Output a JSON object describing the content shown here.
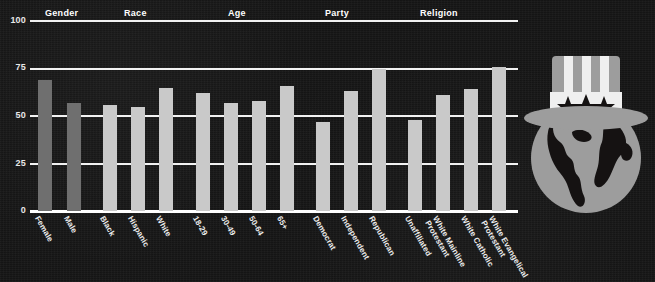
{
  "theme": {
    "background": "#151212",
    "bar_dark": "#6f6f6f",
    "bar_light": "#c9c9c9",
    "axis_color": "#ffffff",
    "text_color": "#ededed"
  },
  "logo": {
    "name": "globe-with-uncle-sam-hat-logo",
    "hat_color": "#9d9d9d",
    "globe_color": "#9d9d9d",
    "land_color": "#151212"
  },
  "chart_data": {
    "type": "bar",
    "title": "",
    "xlabel": "",
    "ylabel": "",
    "ylim": [
      0,
      100
    ],
    "yticks": [
      "0",
      "25",
      "50",
      "75",
      "100"
    ],
    "grid": true,
    "legend": "none",
    "group_headers": [
      "Gender",
      "Race",
      "Age",
      "Party",
      "Religion"
    ],
    "categories": [
      "Female",
      "Male",
      "Black",
      "Hispanic",
      "White",
      "18-29",
      "30-49",
      "50-64",
      "65+",
      "Democrat",
      "Independent",
      "Republican",
      "Unaffiliated",
      "White Mainline\nProtestant",
      "White Catholic",
      "White Evangelical\nProtestant"
    ],
    "values": [
      69,
      57,
      56,
      55,
      65,
      62,
      57,
      58,
      66,
      47,
      63,
      75,
      48,
      61,
      64,
      76
    ],
    "groups": [
      {
        "name": "Gender",
        "categories": [
          "Female",
          "Male"
        ],
        "values": [
          69,
          57
        ],
        "shade": "dark"
      },
      {
        "name": "Race",
        "categories": [
          "Black",
          "Hispanic",
          "White"
        ],
        "values": [
          56,
          55,
          65
        ],
        "shade": "light"
      },
      {
        "name": "Age",
        "categories": [
          "18-29",
          "30-49",
          "50-64",
          "65+"
        ],
        "values": [
          62,
          57,
          58,
          66
        ],
        "shade": "light"
      },
      {
        "name": "Party",
        "categories": [
          "Democrat",
          "Independent",
          "Republican"
        ],
        "values": [
          47,
          63,
          75
        ],
        "shade": "light"
      },
      {
        "name": "Religion",
        "categories": [
          "Unaffiliated",
          "White Mainline Protestant",
          "White Catholic",
          "White Evangelical Protestant"
        ],
        "values": [
          48,
          61,
          64,
          76
        ],
        "shade": "light"
      }
    ]
  }
}
